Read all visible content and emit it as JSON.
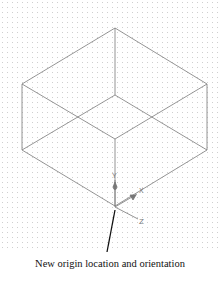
{
  "figure": {
    "axes": {
      "x_label": "X",
      "y_label": "Y",
      "z_label": "Z"
    },
    "caption": "New origin location and orientation",
    "colors": {
      "wireframe": "#7a7a7a",
      "leader": "#111111",
      "axis": "#777777",
      "grid_dot": "#cfcfcf"
    }
  }
}
